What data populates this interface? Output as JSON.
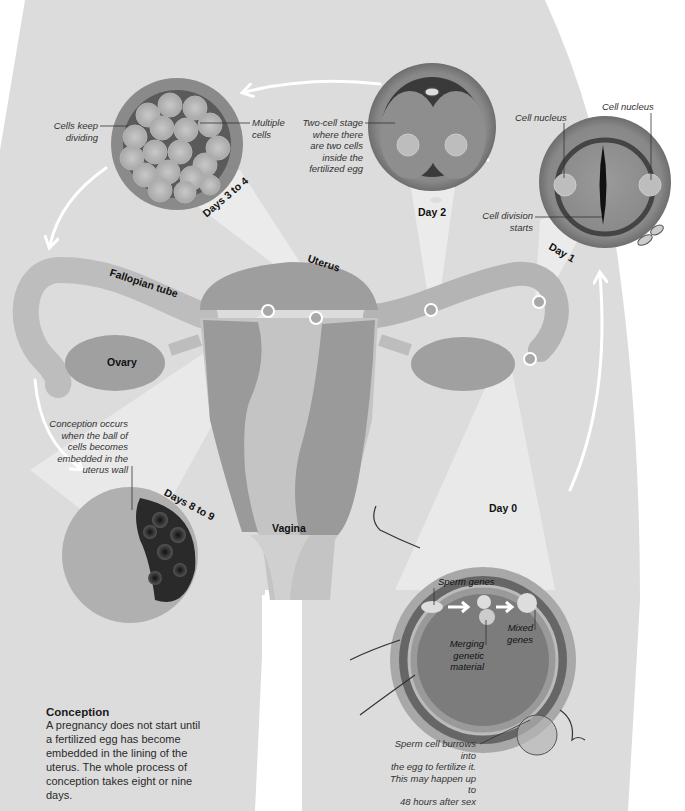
{
  "diagram": {
    "title": "Conception",
    "description": "A pregnancy does not start until a fertilized egg has become embedded in the lining of the uterus. The whole process of conception takes eight or nine days.",
    "description_lines": [
      "A pregnancy does not start until",
      "a fertilized egg has become",
      "embedded in the lining of the",
      "uterus. The whole process of",
      "conception takes eight or nine days."
    ],
    "anatomy_labels": {
      "fallopian_tube": "Fallopian tube",
      "uterus": "Uterus",
      "ovary": "Ovary",
      "vagina": "Vagina"
    },
    "stages": [
      {
        "id": "day0",
        "label": "Day 0",
        "annotations": {
          "sperm_genes": "Sperm genes",
          "merging": [
            "Merging",
            "genetic",
            "material"
          ],
          "mixed": [
            "Mixed",
            "genes"
          ],
          "burrow": [
            "Sperm cell burrows into",
            "the egg to fertilize it.",
            "This may happen up to",
            "48 hours after sex"
          ]
        }
      },
      {
        "id": "day1",
        "label": "Day 1",
        "annotations": {
          "nucleus_left": "Cell nucleus",
          "nucleus_right": "Cell nucleus",
          "division": [
            "Cell division",
            "starts"
          ]
        }
      },
      {
        "id": "day2",
        "label": "Day 2",
        "annotations": {
          "two_cell": [
            "Two-cell stage",
            "where there",
            "are two cells",
            "inside the",
            "fertilized egg"
          ]
        }
      },
      {
        "id": "days3to4",
        "label": "Days 3 to 4",
        "annotations": {
          "keep_dividing": [
            "Cells keep",
            "dividing"
          ],
          "multiple": [
            "Multiple",
            "cells"
          ]
        }
      },
      {
        "id": "days8to9",
        "label": "Days 8 to 9",
        "annotations": {
          "implant": [
            "Conception occurs",
            "when the ball of",
            "cells becomes",
            "embedded in the",
            "uterus wall"
          ]
        }
      }
    ],
    "colors": {
      "body_fill": "#d9d9d9",
      "body_light": "#e6e6e6",
      "organ_mid": "#a6a6a6",
      "organ_dark": "#8c8c8c",
      "egg_outer": "#7a7a7a",
      "beam": "#efefef",
      "arrow": "#ffffff"
    }
  }
}
